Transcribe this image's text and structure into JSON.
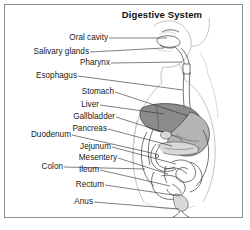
{
  "figure": {
    "title": "Digestive System",
    "background_color": "#ffffff",
    "border_color": "#8e8e8e",
    "text_color": "#1a1a1a"
  },
  "labels": [
    {
      "id": "oral-cavity",
      "text": "Oral cavity"
    },
    {
      "id": "salivary-glands",
      "text": "Salivary glands"
    },
    {
      "id": "pharynx",
      "text": "Pharynx"
    },
    {
      "id": "esophagus",
      "text": "Esophagus"
    },
    {
      "id": "stomach",
      "text": "Stomach"
    },
    {
      "id": "liver",
      "text": "Liver"
    },
    {
      "id": "gallbladder",
      "text": "Gallbladder"
    },
    {
      "id": "pancreas",
      "text": "Pancreas"
    },
    {
      "id": "duodenum",
      "text": "Duodenum"
    },
    {
      "id": "jejunum",
      "text": "Jejunum"
    },
    {
      "id": "mesentery",
      "text": "Mesentery"
    },
    {
      "id": "colon",
      "text": "Colon"
    },
    {
      "id": "ileum",
      "text": "Ileum"
    },
    {
      "id": "rectum",
      "text": "Rectum"
    },
    {
      "id": "anus",
      "text": "Anus"
    }
  ],
  "illustration": {
    "description": "Line drawing of human head and torso in profile showing the digestive tract",
    "shading": {
      "liver": "#8b8b8b",
      "stomach": "#b4b4b4",
      "intestine": "#ffffff",
      "body_outline": "#a9a9a9"
    }
  }
}
